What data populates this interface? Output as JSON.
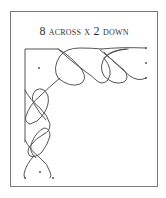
{
  "diagram": {
    "title": {
      "num_across": "8",
      "word_across": "across",
      "x": "x",
      "num_down": "2",
      "word_down": "down"
    },
    "grid": {
      "across": 8,
      "down": 2
    },
    "colors": {
      "frame": "#7a7a7a",
      "line": "#555555",
      "dots": "#555555",
      "background": "#ffffff"
    }
  }
}
